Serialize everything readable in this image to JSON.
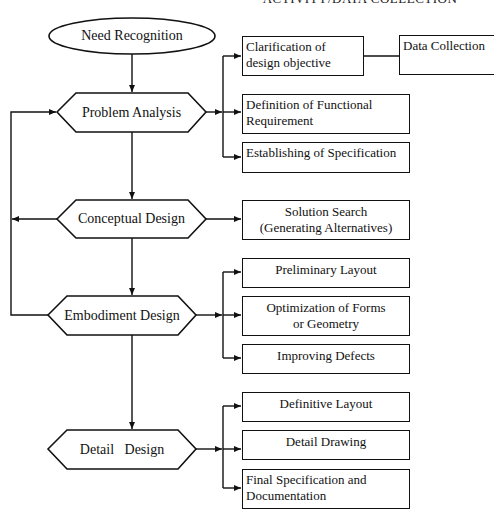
{
  "caption_top": "ACTIVITY/DATA COLLECTION",
  "start": {
    "label": "Need Recognition"
  },
  "stages": [
    {
      "label": "Problem Analysis"
    },
    {
      "label": "Conceptual Design"
    },
    {
      "label": "Embodiment Design"
    },
    {
      "label": "Detail   Design"
    }
  ],
  "problem_analysis_outputs": [
    {
      "label": "Clarification of design objective"
    },
    {
      "label": "Definition of Functional Requirement"
    },
    {
      "label": "Establishing of Specification"
    }
  ],
  "data_collection": {
    "label": "Data Collection"
  },
  "conceptual_outputs": [
    {
      "line1": "Solution Search",
      "line2": "(Generating Alternatives)"
    }
  ],
  "embodiment_outputs": [
    {
      "line1": "Preliminary Layout"
    },
    {
      "line1": "Optimization of Forms",
      "line2": "or Geometry"
    },
    {
      "line1": "Improving Defects"
    }
  ],
  "detail_outputs": [
    {
      "label": "Definitive Layout"
    },
    {
      "label": "Detail Drawing"
    },
    {
      "label": "Final Specification and Documentation"
    }
  ],
  "colors": {
    "stroke": "#111111",
    "background": "#ffffff"
  }
}
